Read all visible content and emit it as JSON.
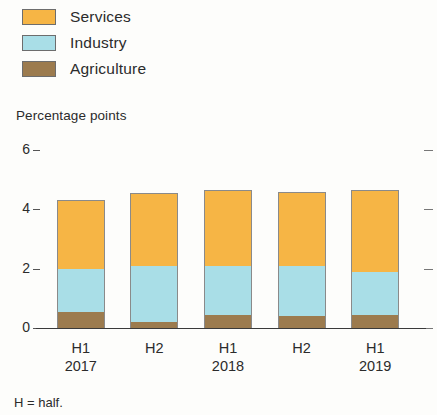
{
  "legend": {
    "items": [
      {
        "label": "Services",
        "color": "#F6B545",
        "name": "legend-item-services"
      },
      {
        "label": "Industry",
        "color": "#A9DEE7",
        "name": "legend-item-industry"
      },
      {
        "label": "Agriculture",
        "color": "#9C7B4E",
        "name": "legend-item-agriculture"
      }
    ]
  },
  "footnote": {
    "text": "H = half."
  },
  "chart_data": {
    "type": "bar",
    "stacked": true,
    "title": "",
    "subtitle": "",
    "xlabel": "",
    "ylabel": "Percentage points",
    "ylim": [
      0,
      6
    ],
    "yticks": [
      0,
      2,
      4,
      6
    ],
    "ytick_labels": [
      "0",
      "2",
      "4",
      "6"
    ],
    "grid": false,
    "legend_position": "top-left",
    "categories": [
      "H1",
      "H2",
      "H1",
      "H2",
      "H1"
    ],
    "category_sublabels": [
      "2017",
      "",
      "2018",
      "",
      "2019"
    ],
    "series": [
      {
        "name": "Agriculture",
        "color": "#9C7B4E",
        "values": [
          0.55,
          0.2,
          0.45,
          0.4,
          0.45
        ]
      },
      {
        "name": "Industry",
        "color": "#A9DEE7",
        "values": [
          1.45,
          1.9,
          1.65,
          1.7,
          1.45
        ]
      },
      {
        "name": "Services",
        "color": "#F6B545",
        "values": [
          2.3,
          2.45,
          2.55,
          2.5,
          2.75
        ]
      }
    ],
    "totals": [
      4.3,
      4.55,
      4.65,
      4.6,
      4.65
    ]
  }
}
